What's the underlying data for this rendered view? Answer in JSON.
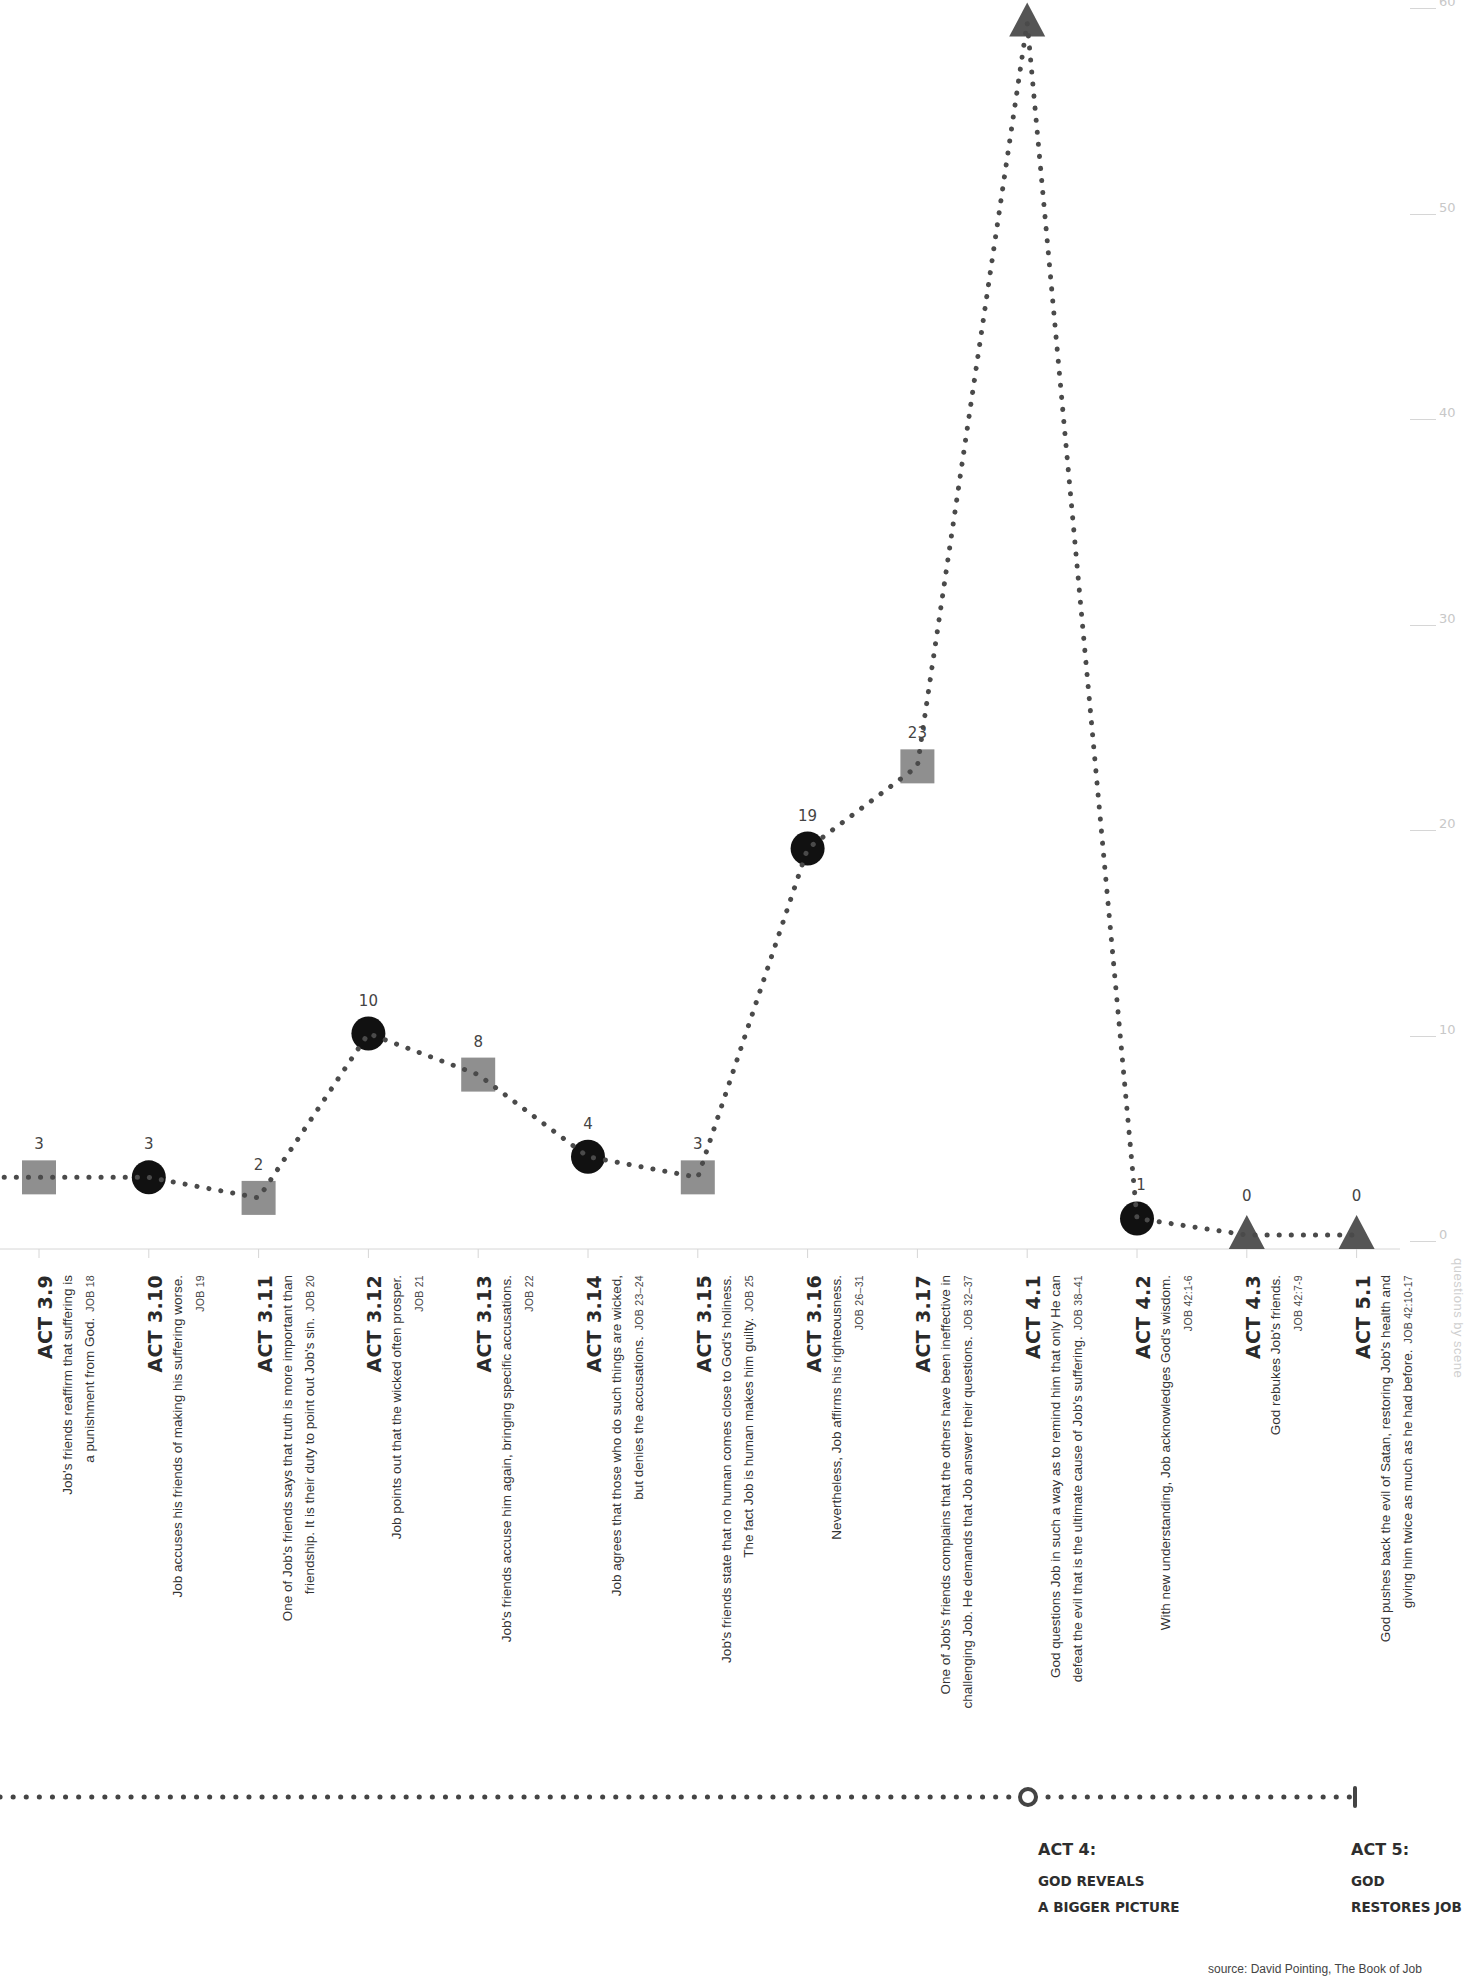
{
  "chart_data": {
    "type": "line",
    "title": "",
    "xlabel": "",
    "ylabel": "questions by scene",
    "ylim": [
      0,
      60
    ],
    "yticks": [
      0,
      10,
      20,
      30,
      40,
      50,
      60
    ],
    "grid": false,
    "categories": [
      "ACT 3.9",
      "ACT 3.10",
      "ACT 3.11",
      "ACT 3.12",
      "ACT 3.13",
      "ACT 3.14",
      "ACT 3.15",
      "ACT 3.16",
      "ACT 3.17",
      "ACT 4.1",
      "ACT 4.2",
      "ACT 4.3",
      "ACT 5.1"
    ],
    "values": [
      3,
      3,
      2,
      10,
      8,
      4,
      3,
      19,
      23,
      59,
      1,
      0,
      0
    ],
    "marker_shapes": [
      "square",
      "circle",
      "square",
      "circle",
      "square",
      "circle",
      "square",
      "circle",
      "square",
      "triangle",
      "circle",
      "triangle",
      "triangle"
    ],
    "line_style": "dotted",
    "marker_colors": {
      "square": "#8f8f8f",
      "circle": "#111111",
      "triangle": "#555555"
    },
    "line_color": "#4a4a4a",
    "axis_color": "#d6d6d6"
  },
  "scenes": [
    {
      "act": "ACT 3.9",
      "lines": [
        "Job's friends reaffirm that suffering is",
        "a punishment from God."
      ],
      "ref": "JOB 18",
      "ref_inline": true
    },
    {
      "act": "ACT 3.10",
      "lines": [
        "Job accuses his friends of making his suffering worse."
      ],
      "ref": "JOB 19",
      "ref_inline": false
    },
    {
      "act": "ACT 3.11",
      "lines": [
        "One of Job's friends says that truth is more important than",
        "friendship. It is their duty to point out Job's sin."
      ],
      "ref": "JOB 20",
      "ref_inline": true
    },
    {
      "act": "ACT 3.12",
      "lines": [
        "Job points out that the wicked often prosper."
      ],
      "ref": "JOB 21",
      "ref_inline": false
    },
    {
      "act": "ACT 3.13",
      "lines": [
        "Job's friends accuse him again, bringing specific accusations."
      ],
      "ref": "JOB 22",
      "ref_inline": false
    },
    {
      "act": "ACT 3.14",
      "lines": [
        "Job agrees that those who do such things are wicked,",
        "but denies the accusations."
      ],
      "ref": "JOB 23–24",
      "ref_inline": true
    },
    {
      "act": "ACT 3.15",
      "lines": [
        "Job's friends state that no human comes close to God's holiness.",
        "The fact Job is human makes him guilty."
      ],
      "ref": "JOB 25",
      "ref_inline": true
    },
    {
      "act": "ACT 3.16",
      "lines": [
        "Nevertheless, Job affirms his righteousness."
      ],
      "ref": "JOB 26–31",
      "ref_inline": false
    },
    {
      "act": "ACT 3.17",
      "lines": [
        "One of Job's friends complains that the others have been ineffective in",
        "challenging Job. He demands that Job answer their questions."
      ],
      "ref": "JOB 32–37",
      "ref_inline": true
    },
    {
      "act": "ACT 4.1",
      "lines": [
        "God questions Job in such a way as to remind him that only He can",
        "defeat the evil that is the ultimate cause of Job's suffering."
      ],
      "ref": "JOB 38–41",
      "ref_inline": true
    },
    {
      "act": "ACT 4.2",
      "lines": [
        "With new understanding, Job acknowledges God's wisdom."
      ],
      "ref": "JOB 42:1-6",
      "ref_inline": false
    },
    {
      "act": "ACT 4.3",
      "lines": [
        "God rebukes Job's friends."
      ],
      "ref": "JOB 42:7-9",
      "ref_inline": false
    },
    {
      "act": "ACT 5.1",
      "lines": [
        "God pushes back the evil of Satan, restoring Job's health and",
        "giving him twice as much as he had before."
      ],
      "ref": "JOB 42:10-17",
      "ref_inline": true
    }
  ],
  "timeline": {
    "acts": [
      {
        "head": "ACT 4:",
        "sub1": "GOD REVEALS",
        "sub2": "A BIGGER PICTURE",
        "marker": "open-circle"
      },
      {
        "head": "ACT 5:",
        "sub1": "GOD",
        "sub2": "RESTORES JOB",
        "marker": "end-bar"
      }
    ]
  },
  "source": "source: David Pointing, The Book of Job"
}
